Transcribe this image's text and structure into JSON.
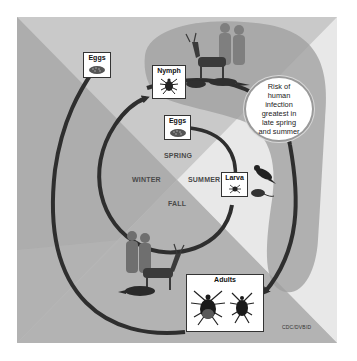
{
  "diagram": {
    "stages": {
      "eggs_top": "Eggs",
      "nymph": "Nymph",
      "eggs_inner": "Eggs",
      "larva": "Larva",
      "adults": "Adults"
    },
    "seasons": {
      "spring": "SPRING",
      "summer": "SUMMER",
      "fall": "FALL",
      "winter": "WINTER"
    },
    "risk_note": "Risk of\nhuman\ninfection\ngreatest in\nlate spring\nand summer",
    "credit": "CDC/DVBID",
    "hosts": {
      "nymph_hosts": [
        "humans",
        "deer",
        "dog/fox",
        "small mammals"
      ],
      "larva_hosts": [
        "bird",
        "mouse"
      ],
      "adult_hosts": [
        "humans",
        "deer",
        "dog/fox"
      ]
    },
    "colors": {
      "background": "#ffffff",
      "dark_quadrant": "#a9a9a9",
      "mid_quadrant": "#bdbdbd",
      "light_quadrant": "#e6e6e6",
      "risk_band": "#9a9a9a",
      "arrow": "#2e2e2e"
    }
  }
}
